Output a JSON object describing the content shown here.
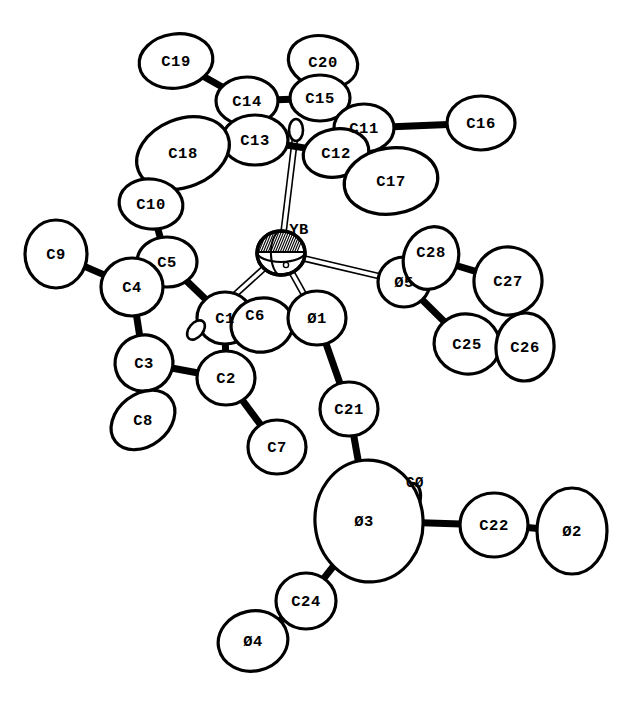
{
  "figure": {
    "background_color": "#ffffff",
    "line_color": "#000000",
    "width": 629,
    "height": 702
  },
  "atoms": [
    {
      "id": "C19",
      "label": "C19",
      "x": 176,
      "y": 61,
      "rx": 37,
      "ry": 27,
      "rot": -8,
      "lx": 176,
      "ly": 61,
      "element": "C",
      "kind": "methyl"
    },
    {
      "id": "C20",
      "label": "C20",
      "x": 323,
      "y": 62,
      "rx": 35,
      "ry": 26,
      "rot": 12,
      "lx": 323,
      "ly": 62,
      "element": "C",
      "kind": "methyl"
    },
    {
      "id": "C14",
      "label": "C14",
      "x": 247,
      "y": 101,
      "rx": 31,
      "ry": 24,
      "rot": 0,
      "lx": 247,
      "ly": 101,
      "element": "C",
      "kind": "ring"
    },
    {
      "id": "C15",
      "label": "C15",
      "x": 320,
      "y": 98,
      "rx": 30,
      "ry": 23,
      "rot": 0,
      "lx": 320,
      "ly": 98,
      "element": "C",
      "kind": "ring"
    },
    {
      "id": "C11",
      "label": "C11",
      "x": 364,
      "y": 128,
      "rx": 30,
      "ry": 24,
      "rot": 0,
      "lx": 364,
      "ly": 128,
      "element": "C",
      "kind": "ring"
    },
    {
      "id": "C16",
      "label": "C16",
      "x": 481,
      "y": 123,
      "rx": 34,
      "ry": 27,
      "rot": 0,
      "lx": 481,
      "ly": 123,
      "element": "C",
      "kind": "methyl"
    },
    {
      "id": "C13",
      "label": "C13",
      "x": 255,
      "y": 140,
      "rx": 33,
      "ry": 25,
      "rot": 0,
      "lx": 255,
      "ly": 140,
      "element": "C",
      "kind": "ring"
    },
    {
      "id": "C12",
      "label": "C12",
      "x": 336,
      "y": 153,
      "rx": 33,
      "ry": 24,
      "rot": -10,
      "lx": 336,
      "ly": 153,
      "element": "C",
      "kind": "ring"
    },
    {
      "id": "C18",
      "label": "C18",
      "x": 183,
      "y": 153,
      "rx": 48,
      "ry": 34,
      "rot": -22,
      "lx": 183,
      "ly": 153,
      "element": "C",
      "kind": "methyl"
    },
    {
      "id": "C17",
      "label": "C17",
      "x": 391,
      "y": 181,
      "rx": 47,
      "ry": 33,
      "rot": -8,
      "lx": 391,
      "ly": 181,
      "element": "C",
      "kind": "methyl"
    },
    {
      "id": "C10",
      "label": "C10",
      "x": 151,
      "y": 204,
      "rx": 32,
      "ry": 25,
      "rot": 8,
      "lx": 151,
      "ly": 204,
      "element": "C",
      "kind": "methyl"
    },
    {
      "id": "C9",
      "label": "C9",
      "x": 56,
      "y": 254,
      "rx": 31,
      "ry": 34,
      "rot": 0,
      "lx": 56,
      "ly": 254,
      "element": "C",
      "kind": "methyl"
    },
    {
      "id": "C5",
      "label": "C5",
      "x": 167,
      "y": 262,
      "rx": 30,
      "ry": 25,
      "rot": 0,
      "lx": 167,
      "ly": 262,
      "element": "C",
      "kind": "ring"
    },
    {
      "id": "C4",
      "label": "C4",
      "x": 132,
      "y": 287,
      "rx": 31,
      "ry": 29,
      "rot": 0,
      "lx": 132,
      "ly": 287,
      "element": "C",
      "kind": "ring"
    },
    {
      "id": "C1",
      "label": "C1",
      "x": 225,
      "y": 318,
      "rx": 28,
      "ry": 26,
      "rot": 0,
      "lx": 225,
      "ly": 318,
      "element": "C",
      "kind": "ring"
    },
    {
      "id": "C6",
      "label": "C6",
      "x": 262,
      "y": 325,
      "rx": 31,
      "ry": 27,
      "rot": -10,
      "lx": 255,
      "ly": 315,
      "element": "C",
      "kind": "methyl"
    },
    {
      "id": "C3",
      "label": "C3",
      "x": 144,
      "y": 363,
      "rx": 29,
      "ry": 28,
      "rot": -15,
      "lx": 144,
      "ly": 363,
      "element": "C",
      "kind": "ring"
    },
    {
      "id": "C2",
      "label": "C2",
      "x": 226,
      "y": 378,
      "rx": 29,
      "ry": 27,
      "rot": 0,
      "lx": 226,
      "ly": 378,
      "element": "C",
      "kind": "ring"
    },
    {
      "id": "C8",
      "label": "C8",
      "x": 143,
      "y": 420,
      "rx": 35,
      "ry": 26,
      "rot": -38,
      "lx": 143,
      "ly": 420,
      "element": "C",
      "kind": "methyl"
    },
    {
      "id": "C7",
      "label": "C7",
      "x": 277,
      "y": 447,
      "rx": 29,
      "ry": 27,
      "rot": 0,
      "lx": 277,
      "ly": 447,
      "element": "C",
      "kind": "methyl"
    },
    {
      "id": "O1",
      "label": "Ø1",
      "x": 317,
      "y": 318,
      "rx": 29,
      "ry": 27,
      "rot": 0,
      "lx": 317,
      "ly": 318,
      "element": "O",
      "kind": "oxygen"
    },
    {
      "id": "O5",
      "label": "Ø5",
      "x": 404,
      "y": 282,
      "rx": 26,
      "ry": 25,
      "rot": 0,
      "lx": 404,
      "ly": 282,
      "element": "O",
      "kind": "oxygen"
    },
    {
      "id": "C28",
      "label": "C28",
      "x": 431,
      "y": 258,
      "rx": 27,
      "ry": 32,
      "rot": 22,
      "lx": 431,
      "ly": 252,
      "element": "C",
      "kind": "thf"
    },
    {
      "id": "C27",
      "label": "C27",
      "x": 508,
      "y": 281,
      "rx": 34,
      "ry": 34,
      "rot": 10,
      "lx": 508,
      "ly": 281,
      "element": "C",
      "kind": "thf"
    },
    {
      "id": "C25",
      "label": "C25",
      "x": 467,
      "y": 344,
      "rx": 33,
      "ry": 30,
      "rot": 10,
      "lx": 467,
      "ly": 344,
      "element": "C",
      "kind": "thf"
    },
    {
      "id": "C26",
      "label": "C26",
      "x": 525,
      "y": 347,
      "rx": 29,
      "ry": 34,
      "rot": 5,
      "lx": 525,
      "ly": 347,
      "element": "C",
      "kind": "thf"
    },
    {
      "id": "C21",
      "label": "C21",
      "x": 349,
      "y": 409,
      "rx": 29,
      "ry": 27,
      "rot": 0,
      "lx": 349,
      "ly": 409,
      "element": "C",
      "kind": "chain"
    },
    {
      "id": "C0",
      "label": "CØ",
      "x": 410,
      "y": 500,
      "rx": 10,
      "ry": 17,
      "rot": 14,
      "lx": 415,
      "ly": 482,
      "element": "C",
      "kind": "chain"
    },
    {
      "id": "O3",
      "label": "Ø3",
      "x": 369,
      "y": 521,
      "rx": 54,
      "ry": 61,
      "rot": -5,
      "lx": 364,
      "ly": 521,
      "element": "O",
      "kind": "oxygen"
    },
    {
      "id": "C22",
      "label": "C22",
      "x": 494,
      "y": 525,
      "rx": 34,
      "ry": 32,
      "rot": 0,
      "lx": 494,
      "ly": 525,
      "element": "C",
      "kind": "chain"
    },
    {
      "id": "O2",
      "label": "Ø2",
      "x": 572,
      "y": 531,
      "rx": 35,
      "ry": 43,
      "rot": 0,
      "lx": 572,
      "ly": 531,
      "element": "O",
      "kind": "oxygen"
    },
    {
      "id": "C24",
      "label": "C24",
      "x": 306,
      "y": 601,
      "rx": 30,
      "ry": 28,
      "rot": 0,
      "lx": 306,
      "ly": 601,
      "element": "C",
      "kind": "chain"
    },
    {
      "id": "O4",
      "label": "Ø4",
      "x": 253,
      "y": 641,
      "rx": 35,
      "ry": 30,
      "rot": -12,
      "lx": 253,
      "ly": 641,
      "element": "O",
      "kind": "oxygen"
    },
    {
      "id": "YB",
      "label": "YB",
      "x": 281,
      "y": 253,
      "rx": 24,
      "ry": 22,
      "rot": 0,
      "lx": 299,
      "ly": 229,
      "element": "Yb",
      "kind": "metal"
    },
    {
      "id": "CP1",
      "label": "",
      "x": 296,
      "y": 130,
      "rx": 7,
      "ry": 11,
      "rot": 0,
      "lx": 296,
      "ly": 130,
      "element": "X",
      "kind": "centroid"
    },
    {
      "id": "CP2",
      "label": "",
      "x": 196,
      "y": 330,
      "rx": 7,
      "ry": 11,
      "rot": 40,
      "lx": 196,
      "ly": 330,
      "element": "X",
      "kind": "centroid"
    }
  ],
  "bonds": [
    {
      "from": "C19",
      "to": "C14",
      "style": "solid"
    },
    {
      "from": "C14",
      "to": "C15",
      "style": "solid"
    },
    {
      "from": "C20",
      "to": "C15",
      "style": "solid"
    },
    {
      "from": "C15",
      "to": "C11",
      "style": "solid"
    },
    {
      "from": "C11",
      "to": "C16",
      "style": "solid"
    },
    {
      "from": "C11",
      "to": "C12",
      "style": "solid"
    },
    {
      "from": "C12",
      "to": "C17",
      "style": "solid"
    },
    {
      "from": "C12",
      "to": "C13",
      "style": "solid"
    },
    {
      "from": "C13",
      "to": "C14",
      "style": "solid"
    },
    {
      "from": "C13",
      "to": "C18",
      "style": "solid"
    },
    {
      "from": "C5",
      "to": "C10",
      "style": "solid"
    },
    {
      "from": "C5",
      "to": "C4",
      "style": "solid"
    },
    {
      "from": "C4",
      "to": "C9",
      "style": "solid"
    },
    {
      "from": "C4",
      "to": "C3",
      "style": "solid"
    },
    {
      "from": "C3",
      "to": "C8",
      "style": "solid"
    },
    {
      "from": "C3",
      "to": "C2",
      "style": "solid"
    },
    {
      "from": "C2",
      "to": "C7",
      "style": "solid"
    },
    {
      "from": "C2",
      "to": "C1",
      "style": "solid"
    },
    {
      "from": "C1",
      "to": "C6",
      "style": "solid"
    },
    {
      "from": "C1",
      "to": "C5",
      "style": "solid"
    },
    {
      "from": "O5",
      "to": "C28",
      "style": "solid"
    },
    {
      "from": "C28",
      "to": "C27",
      "style": "solid"
    },
    {
      "from": "C27",
      "to": "C26",
      "style": "solid"
    },
    {
      "from": "C26",
      "to": "C25",
      "style": "solid"
    },
    {
      "from": "C25",
      "to": "O5",
      "style": "solid"
    },
    {
      "from": "O1",
      "to": "C21",
      "style": "solid"
    },
    {
      "from": "C21",
      "to": "O3",
      "style": "solid"
    },
    {
      "from": "O3",
      "to": "C22",
      "style": "solid"
    },
    {
      "from": "C22",
      "to": "O2",
      "style": "solid"
    },
    {
      "from": "O3",
      "to": "C24",
      "style": "solid"
    },
    {
      "from": "C24",
      "to": "O4",
      "style": "solid"
    },
    {
      "from": "YB",
      "to": "CP1",
      "style": "open"
    },
    {
      "from": "YB",
      "to": "CP2",
      "style": "open"
    },
    {
      "from": "YB",
      "to": "O5",
      "style": "open"
    },
    {
      "from": "YB",
      "to": "O1",
      "style": "open"
    }
  ],
  "legend": {
    "central_metal": "YB",
    "ring_a_atoms": [
      "C11",
      "C12",
      "C13",
      "C14",
      "C15"
    ],
    "ring_a_methyls": [
      "C16",
      "C17",
      "C18",
      "C19",
      "C20"
    ],
    "ring_b_atoms": [
      "C1",
      "C2",
      "C3",
      "C4",
      "C5"
    ],
    "ring_b_methyls": [
      "C6",
      "C7",
      "C8",
      "C9",
      "C10"
    ],
    "thf_atoms": [
      "Ø5",
      "C25",
      "C26",
      "C27",
      "C28"
    ],
    "oxygen_atoms": [
      "Ø1",
      "Ø2",
      "Ø3",
      "Ø4",
      "Ø5"
    ]
  }
}
